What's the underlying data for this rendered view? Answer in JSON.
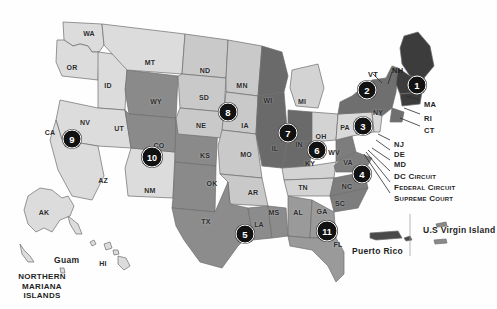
{
  "map": {
    "title": "United States Federal Judicial Circuits Map",
    "background_color": "#ffffff"
  },
  "palette": {
    "circuit1": "#3c3c3c",
    "circuit2": "#6f6f6f",
    "circuit3": "#d9d9d9",
    "circuit4": "#7d7d7d",
    "circuit5": "#8c8c8c",
    "circuit6": "#d3d3d3",
    "circuit7": "#6a6a6a",
    "circuit8": "#c9c9c9",
    "circuit9": "#dcdcdc",
    "circuit10": "#8a8a8a",
    "circuit11": "#9a9a9a",
    "border": "#6d6d6d",
    "badge_fill": "#121212",
    "badge_text": "#ffffff",
    "label_text": "#2b2b2b"
  },
  "circuits": [
    {
      "number": "1",
      "x": 417,
      "y": 85,
      "name": "first-circuit"
    },
    {
      "number": "2",
      "x": 367,
      "y": 90,
      "name": "second-circuit"
    },
    {
      "number": "3",
      "x": 363,
      "y": 126,
      "name": "third-circuit"
    },
    {
      "number": "4",
      "x": 362,
      "y": 174,
      "name": "fourth-circuit"
    },
    {
      "number": "5",
      "x": 245,
      "y": 234,
      "name": "fifth-circuit"
    },
    {
      "number": "6",
      "x": 317,
      "y": 150,
      "name": "sixth-circuit"
    },
    {
      "number": "7",
      "x": 288,
      "y": 133,
      "name": "seventh-circuit"
    },
    {
      "number": "8",
      "x": 228,
      "y": 112,
      "name": "eighth-circuit"
    },
    {
      "number": "9",
      "x": 72,
      "y": 139,
      "name": "ninth-circuit"
    },
    {
      "number": "10",
      "x": 152,
      "y": 157,
      "name": "tenth-circuit"
    },
    {
      "number": "11",
      "x": 327,
      "y": 231,
      "name": "eleventh-circuit"
    }
  ],
  "states": [
    {
      "abbr": "WA",
      "x": 89,
      "y": 33
    },
    {
      "abbr": "OR",
      "x": 72,
      "y": 67
    },
    {
      "abbr": "ID",
      "x": 108,
      "y": 85
    },
    {
      "abbr": "MT",
      "x": 150,
      "y": 62
    },
    {
      "abbr": "ND",
      "x": 205,
      "y": 70
    },
    {
      "abbr": "MN",
      "x": 242,
      "y": 85
    },
    {
      "abbr": "SD",
      "x": 204,
      "y": 97
    },
    {
      "abbr": "WY",
      "x": 156,
      "y": 101
    },
    {
      "abbr": "NV",
      "x": 85,
      "y": 122
    },
    {
      "abbr": "CA",
      "x": 50,
      "y": 132
    },
    {
      "abbr": "UT",
      "x": 119,
      "y": 128
    },
    {
      "abbr": "CO",
      "x": 159,
      "y": 145
    },
    {
      "abbr": "NE",
      "x": 201,
      "y": 125
    },
    {
      "abbr": "IA",
      "x": 245,
      "y": 125
    },
    {
      "abbr": "WI",
      "x": 268,
      "y": 100
    },
    {
      "abbr": "MI",
      "x": 302,
      "y": 101
    },
    {
      "abbr": "IL",
      "x": 275,
      "y": 148
    },
    {
      "abbr": "IN",
      "x": 299,
      "y": 144
    },
    {
      "abbr": "OH",
      "x": 321,
      "y": 136
    },
    {
      "abbr": "PA",
      "x": 345,
      "y": 127
    },
    {
      "abbr": "NY",
      "x": 378,
      "y": 112
    },
    {
      "abbr": "KS",
      "x": 205,
      "y": 155
    },
    {
      "abbr": "MO",
      "x": 246,
      "y": 154
    },
    {
      "abbr": "KY",
      "x": 310,
      "y": 163
    },
    {
      "abbr": "WV",
      "x": 334,
      "y": 152
    },
    {
      "abbr": "VA",
      "x": 348,
      "y": 162
    },
    {
      "abbr": "AZ",
      "x": 103,
      "y": 180
    },
    {
      "abbr": "NM",
      "x": 150,
      "y": 190
    },
    {
      "abbr": "OK",
      "x": 212,
      "y": 183
    },
    {
      "abbr": "AR",
      "x": 253,
      "y": 192
    },
    {
      "abbr": "TN",
      "x": 303,
      "y": 187
    },
    {
      "abbr": "NC",
      "x": 347,
      "y": 186
    },
    {
      "abbr": "SC",
      "x": 340,
      "y": 203
    },
    {
      "abbr": "GA",
      "x": 322,
      "y": 211
    },
    {
      "abbr": "AL",
      "x": 298,
      "y": 212
    },
    {
      "abbr": "MS",
      "x": 274,
      "y": 212
    },
    {
      "abbr": "LA",
      "x": 259,
      "y": 224
    },
    {
      "abbr": "TX",
      "x": 206,
      "y": 221
    },
    {
      "abbr": "FL",
      "x": 338,
      "y": 244
    },
    {
      "abbr": "AK",
      "x": 44,
      "y": 212
    },
    {
      "abbr": "HI",
      "x": 103,
      "y": 263
    }
  ],
  "callouts": [
    {
      "label": "VT",
      "name": "callout-vt",
      "x": 368,
      "y": 70
    },
    {
      "label": "NH",
      "name": "callout-nh",
      "x": 392,
      "y": 66
    },
    {
      "label": "MA",
      "name": "callout-ma",
      "x": 424,
      "y": 100
    },
    {
      "label": "RI",
      "name": "callout-ri",
      "x": 424,
      "y": 114
    },
    {
      "label": "CT",
      "name": "callout-ct",
      "x": 424,
      "y": 126
    },
    {
      "label": "NJ",
      "name": "callout-nj",
      "x": 394,
      "y": 140
    },
    {
      "label": "DE",
      "name": "callout-de",
      "x": 394,
      "y": 150
    },
    {
      "label": "MD",
      "name": "callout-md",
      "x": 394,
      "y": 160
    }
  ],
  "court_callouts": [
    {
      "label": "DC Circuit",
      "upper": "DC C",
      "rest": "IRCUIT",
      "name": "callout-dc-circuit",
      "x": 394,
      "y": 172
    },
    {
      "label": "Federal Circuit",
      "upper": "F",
      "rest": "EDERAL",
      "name": "callout-federal-circuit",
      "x": 394,
      "y": 183
    },
    {
      "label": "Supreme Court",
      "upper": "S",
      "rest": "UPREME",
      "name": "callout-supreme-court",
      "x": 394,
      "y": 194
    }
  ],
  "territories": [
    {
      "label": "Puerto Rico",
      "name": "territory-puerto-rico",
      "x": 393,
      "y": 247
    },
    {
      "label": "U.S Virgin Island",
      "name": "territory-us-virgin-island",
      "x": 463,
      "y": 230
    },
    {
      "label": "Guam",
      "name": "territory-guam",
      "x": 70,
      "y": 259
    },
    {
      "label": "Northern Mariana Islands",
      "name": "territory-northern-mariana-islands",
      "x": 38,
      "y": 283
    }
  ]
}
